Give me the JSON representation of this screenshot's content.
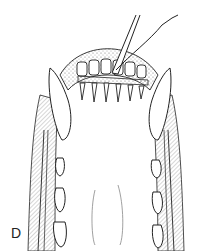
{
  "figure": {
    "panel_label": "D",
    "colors": {
      "line": "#1a1a1a",
      "hatch": "#8a8a8a",
      "background": "#ffffff"
    }
  }
}
